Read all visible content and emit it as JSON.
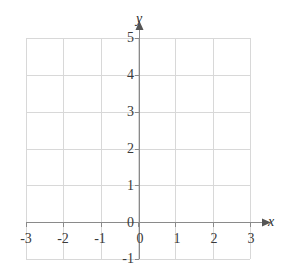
{
  "figure": {
    "kind": "coordinate-grid",
    "background_color": "#ffffff",
    "grid_color": "#d8d8d8",
    "axis_color": "#8a8a8a",
    "label_color": "#3a3a3a"
  },
  "axes": {
    "x_axis_name": "x",
    "y_axis_name": "y",
    "x_tick_labels": [
      "-3",
      "-2",
      "-1",
      "0",
      "1",
      "2",
      "3"
    ],
    "y_tick_labels": [
      "-1",
      "0",
      "1",
      "2",
      "3",
      "4",
      "5"
    ],
    "origin_label": "0"
  },
  "chart_data": {
    "type": "scatter",
    "title": "",
    "subtitle": "",
    "xlabel": "x",
    "ylabel": "y",
    "xlim": [
      -3,
      3
    ],
    "ylim": [
      -1,
      5
    ],
    "xticks": [
      -3,
      -2,
      -1,
      0,
      1,
      2,
      3
    ],
    "yticks": [
      -1,
      0,
      1,
      2,
      3,
      4,
      5
    ],
    "xtick_labels": [
      "-3",
      "-2",
      "-1",
      "0",
      "1",
      "2",
      "3"
    ],
    "ytick_labels": [
      "-1",
      "0",
      "1",
      "2",
      "3",
      "4",
      "5"
    ],
    "grid": true,
    "legend": false,
    "legend_position": "none",
    "annotations": [],
    "series": [
      {
        "name": "",
        "x": [],
        "y": []
      }
    ]
  }
}
